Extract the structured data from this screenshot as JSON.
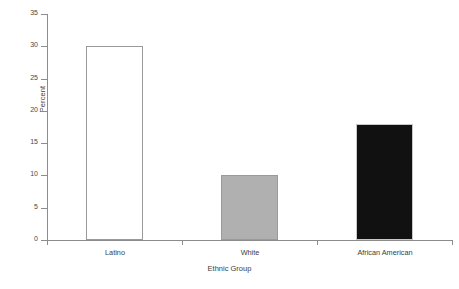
{
  "chart_data": {
    "type": "bar",
    "title": "",
    "subtitle": "",
    "xlabel": "Ethnic Group",
    "ylabel": "Percent",
    "categories": [
      "Latino",
      "White",
      "African American"
    ],
    "values": [
      30,
      10,
      18
    ],
    "series": [
      {
        "name": "Percent",
        "values": [
          30,
          10,
          18
        ]
      }
    ],
    "bar_styles": [
      "white-outline",
      "gray-fill",
      "black-fill"
    ],
    "bar_colors": [
      "#ffffff",
      "#b0b0b0",
      "#111111"
    ],
    "bar_border_colors": [
      "#9a9a9a",
      "#9a9a9a",
      "#c9c9c9"
    ],
    "ylim": [
      0,
      35
    ],
    "ytick_values": [
      0,
      5,
      10,
      15,
      20,
      25,
      30,
      35
    ],
    "ytick_labels": [
      "0",
      "5",
      "10",
      "15",
      "20",
      "25",
      "30",
      "35"
    ],
    "ytick_step": 5,
    "grid": false,
    "legend": false,
    "legend_position": "none",
    "axis_color": "#8d8d8d",
    "text_color": "#3d3d3d",
    "background": "#ffffff"
  },
  "figure": {
    "caption_fragment": ""
  }
}
